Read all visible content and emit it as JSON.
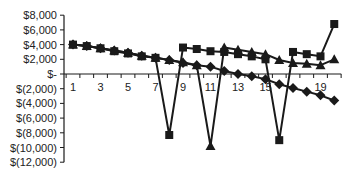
{
  "chart_data": {
    "type": "line",
    "title": "",
    "xlabel": "",
    "ylabel": "",
    "x": [
      1,
      2,
      3,
      4,
      5,
      6,
      7,
      8,
      9,
      10,
      11,
      12,
      13,
      14,
      15,
      16,
      17,
      18,
      19,
      20
    ],
    "x_tick_labels": [
      "1",
      "3",
      "5",
      "7",
      "9",
      "11",
      "13",
      "15",
      "19"
    ],
    "x_tick_positions": [
      1,
      3,
      5,
      7,
      9,
      11,
      13,
      15,
      19
    ],
    "y_tick_labels": [
      "$8,000",
      "$6,000",
      "$4,000",
      "$2,000",
      "$-",
      "$(2,000)",
      "$(4,000)",
      "$(6,000)",
      "$(8,000)",
      "$(10,000)",
      "$(12,000)"
    ],
    "y_tick_values": [
      8000,
      6000,
      4000,
      2000,
      0,
      -2000,
      -4000,
      -6000,
      -8000,
      -10000,
      -12000
    ],
    "ylim": [
      -12000,
      8000
    ],
    "xlim": [
      0.5,
      20.5
    ],
    "grid": false,
    "legend": null,
    "series": [
      {
        "name": "Series diamond",
        "marker": "diamond",
        "color": "#1a1a1a",
        "values": [
          4000,
          3800,
          3500,
          3200,
          2900,
          2500,
          2200,
          1900,
          1500,
          1200,
          1000,
          400,
          0,
          -300,
          -700,
          -1400,
          -1900,
          -2400,
          -2900,
          -3600
        ]
      },
      {
        "name": "Series square",
        "marker": "square",
        "color": "#1a1a1a",
        "values": [
          4000,
          3800,
          3500,
          3100,
          2800,
          2400,
          2200,
          -8300,
          3600,
          3400,
          3100,
          3000,
          2700,
          2400,
          2000,
          -9000,
          3000,
          2700,
          2400,
          6800
        ]
      },
      {
        "name": "Series triangle",
        "marker": "triangle",
        "color": "#1a1a1a",
        "values": [
          4000,
          3800,
          3500,
          3200,
          2900,
          2500,
          2200,
          1900,
          1600,
          1200,
          -9800,
          3600,
          3300,
          3000,
          2700,
          1900,
          1500,
          1400,
          1200,
          2000
        ]
      }
    ]
  },
  "layout": {
    "plot_left": 64,
    "x_first_px": 73,
    "x_step_px": 13.75,
    "y_zero_px": 74,
    "y_px_per_unit": 0.00735,
    "axis_color": "#1a1a1a"
  }
}
